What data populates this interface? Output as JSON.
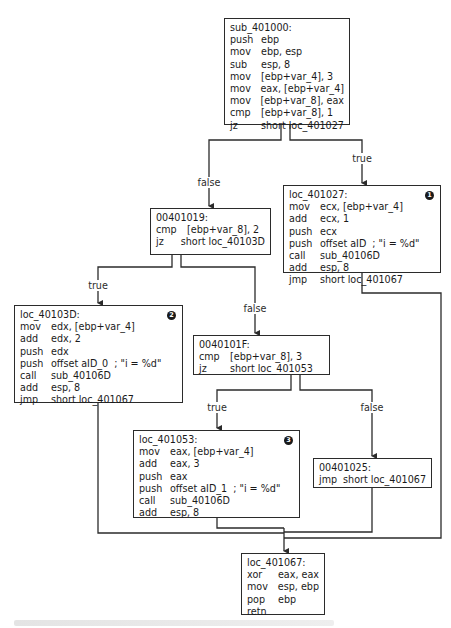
{
  "diagram": {
    "type": "control-flow-graph",
    "colors": {
      "line": "#2b2b2b",
      "box_border": "#2b2b2b",
      "background": "#ffffff",
      "badge": "#1a1a1a"
    },
    "blocks": {
      "sub_401000": {
        "label": "sub_401000:",
        "rows": [
          {
            "op": "push",
            "arg": "ebp"
          },
          {
            "op": "mov",
            "arg": "ebp, esp"
          },
          {
            "op": "sub",
            "arg": "esp, 8"
          },
          {
            "op": "mov",
            "arg": "[ebp+var_4], 3"
          },
          {
            "op": "mov",
            "arg": "eax, [ebp+var_4]"
          },
          {
            "op": "mov",
            "arg": "[ebp+var_8], eax"
          },
          {
            "op": "cmp",
            "arg": "[ebp+var_8], 1"
          },
          {
            "op": "jz",
            "arg": "short loc_401027"
          }
        ]
      },
      "loc_401027": {
        "label": "loc_401027:",
        "badge": "1",
        "rows": [
          {
            "op": "mov",
            "arg": "ecx, [ebp+var_4]"
          },
          {
            "op": "add",
            "arg": "ecx, 1"
          },
          {
            "op": "push",
            "arg": "ecx"
          },
          {
            "op": "push",
            "arg": "offset aID",
            "comment": "; \"i = %d\""
          },
          {
            "op": "call",
            "arg": "sub_40106D"
          },
          {
            "op": "add",
            "arg": "esp, 8"
          },
          {
            "op": "jmp",
            "arg": "short loc_401067"
          }
        ]
      },
      "b_00401019": {
        "label": "00401019:",
        "rows": [
          {
            "op": "cmp",
            "arg": "[ebp+var_8], 2"
          },
          {
            "op": "jz",
            "arg": "short loc_40103D"
          }
        ]
      },
      "loc_40103D": {
        "label": "loc_40103D:",
        "badge": "2",
        "rows": [
          {
            "op": "mov",
            "arg": "edx, [ebp+var_4]"
          },
          {
            "op": "add",
            "arg": "edx, 2"
          },
          {
            "op": "push",
            "arg": "edx"
          },
          {
            "op": "push",
            "arg": "offset aID_0",
            "comment": "; \"i = %d\""
          },
          {
            "op": "call",
            "arg": "sub_40106D"
          },
          {
            "op": "add",
            "arg": "esp, 8"
          },
          {
            "op": "jmp",
            "arg": "short loc_401067"
          }
        ]
      },
      "b_0040101F": {
        "label": "0040101F:",
        "rows": [
          {
            "op": "cmp",
            "arg": "[ebp+var_8], 3"
          },
          {
            "op": "jz",
            "arg": "short loc_401053"
          }
        ]
      },
      "loc_401053": {
        "label": "loc_401053:",
        "badge": "3",
        "rows": [
          {
            "op": "mov",
            "arg": "eax, [ebp+var_4]"
          },
          {
            "op": "add",
            "arg": "eax, 3"
          },
          {
            "op": "push",
            "arg": "eax"
          },
          {
            "op": "push",
            "arg": "offset aID_1",
            "comment": "; \"i = %d\""
          },
          {
            "op": "call",
            "arg": "sub_40106D"
          },
          {
            "op": "add",
            "arg": "esp, 8"
          }
        ]
      },
      "b_00401025": {
        "label": "00401025:",
        "rows": [
          {
            "op": "jmp",
            "arg": "short loc_401067"
          }
        ]
      },
      "loc_401067": {
        "label": "loc_401067:",
        "rows": [
          {
            "op": "xor",
            "arg": "eax, eax"
          },
          {
            "op": "mov",
            "arg": "esp, ebp"
          },
          {
            "op": "pop",
            "arg": "ebp"
          },
          {
            "op": "retn",
            "arg": ""
          }
        ]
      }
    },
    "edge_labels": {
      "e1_false": "false",
      "e1_true": "true",
      "e2_true": "true",
      "e2_false": "false",
      "e3_true": "true",
      "e3_false": "false"
    },
    "edges": [
      {
        "from": "sub_401000",
        "to": "b_00401019",
        "label": "false"
      },
      {
        "from": "sub_401000",
        "to": "loc_401027",
        "label": "true"
      },
      {
        "from": "b_00401019",
        "to": "loc_40103D",
        "label": "true"
      },
      {
        "from": "b_00401019",
        "to": "b_0040101F",
        "label": "false"
      },
      {
        "from": "b_0040101F",
        "to": "loc_401053",
        "label": "true"
      },
      {
        "from": "b_0040101F",
        "to": "b_00401025",
        "label": "false"
      },
      {
        "from": "loc_401027",
        "to": "loc_401067",
        "label": ""
      },
      {
        "from": "loc_40103D",
        "to": "loc_401067",
        "label": ""
      },
      {
        "from": "loc_401053",
        "to": "loc_401067",
        "label": ""
      },
      {
        "from": "b_00401025",
        "to": "loc_401067",
        "label": ""
      }
    ]
  }
}
